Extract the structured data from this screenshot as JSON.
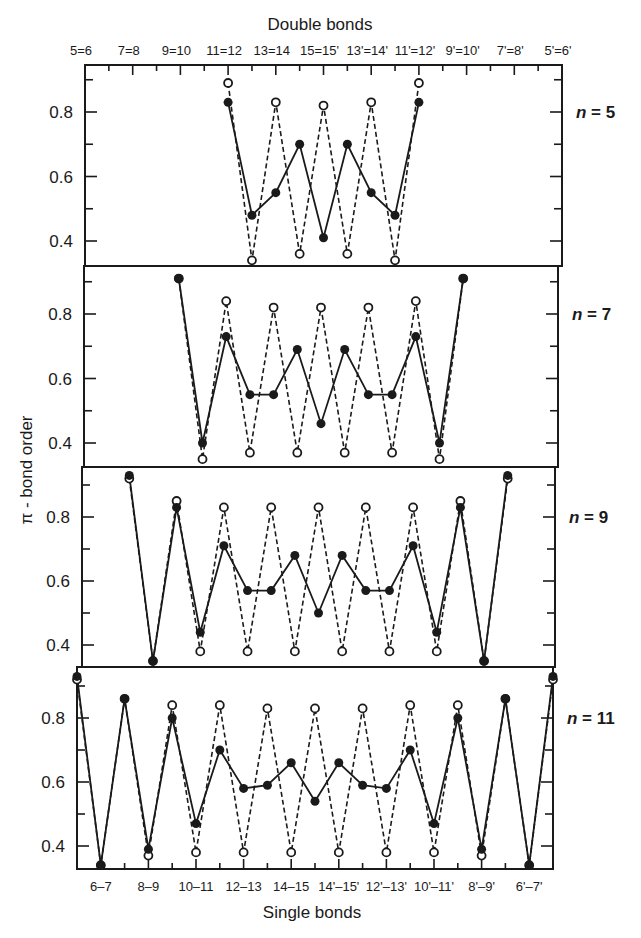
{
  "chart_data": {
    "type": "line",
    "title": "",
    "top_axis_title": "Double bonds",
    "bottom_axis_title": "Single bonds",
    "ylabel": "π - bond order",
    "ylim": [
      0.33,
      0.94
    ],
    "y_ticks": [
      0.4,
      0.6,
      0.8
    ],
    "y_minor_ticks": [
      0.5,
      0.7,
      0.9
    ],
    "grid": false,
    "x_positions": [
      "5=6",
      "6-7",
      "7=8",
      "8-9",
      "9=10",
      "10-11",
      "11=12",
      "12-13",
      "13=14",
      "14-15",
      "15=15'",
      "14'-15'",
      "13'=14'",
      "12'-13'",
      "11'=12'",
      "10'-11'",
      "9'=10'",
      "8'-9'",
      "7'=8'",
      "6'-7'",
      "5'=6'"
    ],
    "top_tick_labels": [
      "5=6",
      "7=8",
      "9=10",
      "11=12",
      "13=14",
      "15=15'",
      "13'=14'",
      "11'=12'",
      "9'=10'",
      "7'=8'",
      "5'=6'"
    ],
    "bottom_tick_labels": [
      "6–7",
      "8–9",
      "10–11",
      "12–13",
      "14–15",
      "14'–15'",
      "12'–13'",
      "10'–11'",
      "8'–9'",
      "6'–7'"
    ],
    "series_styles": [
      {
        "name": "filled",
        "marker": "filled-circle",
        "line": "solid",
        "color": "#1a1a1a"
      },
      {
        "name": "open",
        "marker": "open-circle",
        "line": "dashed",
        "color": "#1a1a1a"
      }
    ],
    "panels": [
      {
        "label_prefix": "n",
        "label_value": "= 5",
        "start_index": 6,
        "series": [
          {
            "name": "filled",
            "values": [
              0.83,
              0.48,
              0.55,
              0.7,
              0.41,
              0.7,
              0.55,
              0.48,
              0.83
            ]
          },
          {
            "name": "open",
            "values": [
              0.89,
              0.34,
              0.83,
              0.36,
              0.82,
              0.36,
              0.83,
              0.34,
              0.89
            ]
          }
        ]
      },
      {
        "label_prefix": "n",
        "label_value": "= 7",
        "start_index": 4,
        "series": [
          {
            "name": "filled",
            "values": [
              0.91,
              0.4,
              0.73,
              0.55,
              0.55,
              0.69,
              0.46,
              0.69,
              0.55,
              0.55,
              0.73,
              0.4,
              0.91
            ]
          },
          {
            "name": "open",
            "values": [
              0.91,
              0.35,
              0.84,
              0.37,
              0.82,
              0.37,
              0.82,
              0.37,
              0.82,
              0.37,
              0.84,
              0.35,
              0.91
            ]
          }
        ]
      },
      {
        "label_prefix": "n",
        "label_value": "= 9",
        "start_index": 2,
        "series": [
          {
            "name": "filled",
            "values": [
              0.93,
              0.35,
              0.83,
              0.44,
              0.71,
              0.57,
              0.57,
              0.68,
              0.5,
              0.68,
              0.57,
              0.57,
              0.71,
              0.44,
              0.83,
              0.35,
              0.93
            ]
          },
          {
            "name": "open",
            "values": [
              0.92,
              0.35,
              0.85,
              0.38,
              0.83,
              0.38,
              0.83,
              0.38,
              0.83,
              0.38,
              0.83,
              0.38,
              0.83,
              0.38,
              0.85,
              0.35,
              0.92
            ]
          }
        ]
      },
      {
        "label_prefix": "n",
        "label_value": "= 11",
        "start_index": 0,
        "series": [
          {
            "name": "filled",
            "values": [
              0.93,
              0.34,
              0.86,
              0.39,
              0.8,
              0.47,
              0.7,
              0.58,
              0.59,
              0.66,
              0.54,
              0.66,
              0.59,
              0.58,
              0.7,
              0.47,
              0.8,
              0.39,
              0.86,
              0.34,
              0.93
            ]
          },
          {
            "name": "open",
            "values": [
              0.92,
              0.34,
              0.86,
              0.37,
              0.84,
              0.38,
              0.84,
              0.38,
              0.83,
              0.38,
              0.83,
              0.38,
              0.83,
              0.38,
              0.84,
              0.38,
              0.84,
              0.37,
              0.86,
              0.34,
              0.92
            ]
          }
        ]
      }
    ]
  }
}
